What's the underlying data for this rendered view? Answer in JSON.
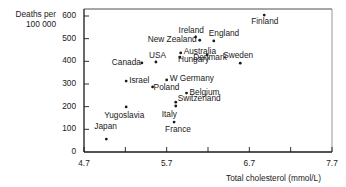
{
  "chart_data": {
    "type": "scatter",
    "title": "",
    "xlabel": "Total cholesterol (mmol/L)",
    "ylabel_line1": "Deaths per",
    "ylabel_line2": "100 000",
    "xlim": [
      4.7,
      7.7
    ],
    "ylim": [
      0,
      620
    ],
    "x_ticks": [
      4.7,
      5.2,
      5.7,
      6.2,
      6.7,
      7.2,
      7.7
    ],
    "x_tick_labels": [
      "4.7",
      "5.7",
      "6.7",
      "7.7"
    ],
    "y_ticks": [
      0,
      100,
      200,
      300,
      400,
      500,
      600
    ],
    "y_tick_labels": [
      "0",
      "100",
      "200",
      "300",
      "400",
      "500",
      "600"
    ],
    "grid": false,
    "legend": "none",
    "points": [
      {
        "label": "Finland",
        "x": 6.88,
        "y": 604,
        "lx": -13,
        "ly": 2,
        "anchor": "left"
      },
      {
        "label": "Ireland",
        "x": 6.05,
        "y": 507,
        "lx": -17,
        "ly": -11,
        "anchor": "left"
      },
      {
        "label": "England",
        "x": 6.27,
        "y": 490,
        "lx": -5,
        "ly": -12,
        "anchor": "left"
      },
      {
        "label": "New Zealand",
        "x": 6.1,
        "y": 493,
        "lx": -52,
        "ly": -5,
        "anchor": "left"
      },
      {
        "label": "Australia",
        "x": 5.87,
        "y": 437,
        "lx": 3,
        "ly": -6,
        "anchor": "left"
      },
      {
        "label": "Hungary",
        "x": 5.86,
        "y": 419,
        "lx": -2,
        "ly": -2,
        "anchor": "left"
      },
      {
        "label": "Denmark",
        "x": 6.19,
        "y": 428,
        "lx": -14,
        "ly": -2,
        "anchor": "left"
      },
      {
        "label": "Sweden",
        "x": 6.59,
        "y": 392,
        "lx": -17,
        "ly": -12,
        "anchor": "left"
      },
      {
        "label": "Canada",
        "x": 5.4,
        "y": 393,
        "lx": -30,
        "ly": -5,
        "anchor": "left"
      },
      {
        "label": "USA",
        "x": 5.57,
        "y": 397,
        "lx": -7,
        "ly": -11,
        "anchor": "left"
      },
      {
        "label": "Israel",
        "x": 5.21,
        "y": 313,
        "lx": 3,
        "ly": -5,
        "anchor": "left"
      },
      {
        "label": "W Germany",
        "x": 5.7,
        "y": 318,
        "lx": 3,
        "ly": -6,
        "anchor": "left"
      },
      {
        "label": "Poland",
        "x": 5.53,
        "y": 287,
        "lx": 1,
        "ly": -4,
        "anchor": "left"
      },
      {
        "label": "Belgium",
        "x": 5.94,
        "y": 260,
        "lx": 3,
        "ly": -5,
        "anchor": "left"
      },
      {
        "label": "Switzerland",
        "x": 5.81,
        "y": 220,
        "lx": 2,
        "ly": -8,
        "anchor": "left"
      },
      {
        "label": "Italy",
        "x": 5.81,
        "y": 203,
        "lx": -14,
        "ly": 4,
        "anchor": "left"
      },
      {
        "label": "Yugoslavia",
        "x": 5.21,
        "y": 199,
        "lx": -22,
        "ly": 4,
        "anchor": "left"
      },
      {
        "label": "France",
        "x": 5.79,
        "y": 132,
        "lx": -9,
        "ly": 3,
        "anchor": "left"
      },
      {
        "label": "Japan",
        "x": 4.97,
        "y": 57,
        "lx": -12,
        "ly": -17,
        "anchor": "left"
      }
    ]
  },
  "colors": {
    "ink": "#1a1a1a",
    "frame": "#2a2a2a",
    "frame_right": "#8a8a8a",
    "background": "#ffffff"
  }
}
